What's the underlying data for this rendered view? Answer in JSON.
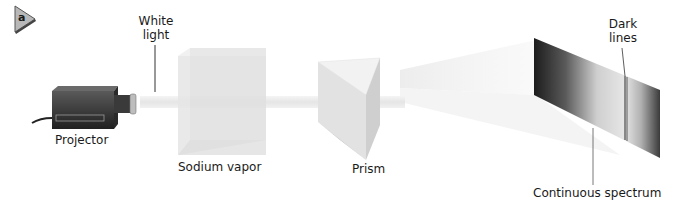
{
  "figure": {
    "panel_marker": "a"
  },
  "labels": {
    "white_light_line1": "White",
    "white_light_line2": "light",
    "projector": "Projector",
    "sodium_vapor": "Sodium vapor",
    "prism": "Prism",
    "dark_lines_line1": "Dark",
    "dark_lines_line2": "lines",
    "continuous_spectrum": "Continuous spectrum"
  },
  "colors": {
    "marker_fill": "#b8b8b8",
    "projector_body": "#3a3a3a",
    "beam": "#ececec",
    "spectrum_dark": "#1e1e1e",
    "spectrum_light": "#e8e8e8"
  }
}
